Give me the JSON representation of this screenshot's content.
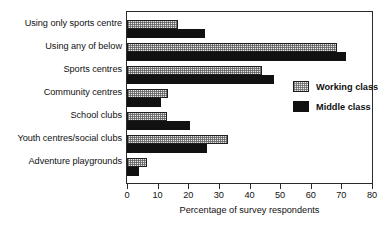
{
  "chart_data": {
    "type": "bar",
    "orientation": "horizontal",
    "title": "",
    "xlabel": "Percentage of survey respondents",
    "ylabel": "",
    "xlim": [
      0,
      80
    ],
    "xticks": [
      0,
      10,
      20,
      30,
      40,
      50,
      60,
      70,
      80
    ],
    "grid": false,
    "legend_position": "center-right-inside",
    "categories": [
      "Using only sports centre",
      "Using any of below",
      "Sports centres",
      "Community centres",
      "School clubs",
      "Youth centres/social clubs",
      "Adventure playgrounds"
    ],
    "series": [
      {
        "name": "Working class",
        "fill": "stippled-light",
        "color": "#e8e8e8",
        "values": [
          16.5,
          68.5,
          44,
          13.5,
          13,
          33,
          6.5
        ]
      },
      {
        "name": "Middle class",
        "fill": "solid-black",
        "color": "#111111",
        "values": [
          25.5,
          71.5,
          48,
          11,
          20.5,
          26,
          4
        ]
      }
    ]
  },
  "axis": {
    "tick_labels": [
      "0",
      "10",
      "20",
      "30",
      "40",
      "50",
      "60",
      "70",
      "80"
    ],
    "title": "Percentage of survey respondents"
  },
  "legend": {
    "items": [
      {
        "label": "Working class"
      },
      {
        "label": "Middle class"
      }
    ]
  }
}
